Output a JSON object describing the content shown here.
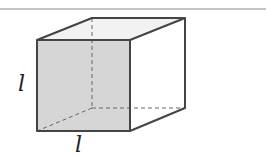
{
  "diagram": {
    "type": "cube",
    "labels": {
      "height": "l",
      "width": "l"
    },
    "colors": {
      "front_face": "#d4d4d4",
      "top_face": "#f2f2f2",
      "edge": "#444444",
      "hidden_edge": "#666666",
      "rule": "#888888"
    }
  }
}
